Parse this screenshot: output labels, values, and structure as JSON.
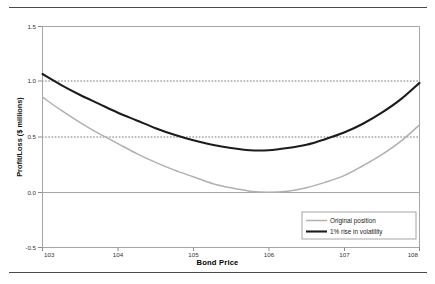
{
  "figure": {
    "clipped_header_text": "",
    "x_axis_title": "Bond Price"
  },
  "chart_data": {
    "type": "line",
    "title": "",
    "xlabel": "Bond Price",
    "ylabel": "Profit/Loss ($ millions)",
    "xlim": [
      103,
      108
    ],
    "ylim": [
      -0.5,
      1.5
    ],
    "xticks": [
      "103",
      "104",
      "105",
      "106",
      "107",
      "108"
    ],
    "yticks": [
      "1.5",
      "1.0",
      "0.5",
      "0.0",
      "-0.5"
    ],
    "grid": "dashed horizontal gridlines at 0.5 and 1.0; solid axis line at 0.0",
    "legend_position": "lower right inside plot",
    "x": [
      103.0,
      103.25,
      103.5,
      103.75,
      104.0,
      104.25,
      104.5,
      104.75,
      105.0,
      105.25,
      105.5,
      105.75,
      106.0,
      106.25,
      106.5,
      106.75,
      107.0,
      107.25,
      107.5,
      107.75,
      108.0
    ],
    "series": [
      {
        "name": "Original position",
        "color": "#b0b0b0",
        "values": [
          0.86,
          0.74,
          0.63,
          0.53,
          0.44,
          0.35,
          0.27,
          0.2,
          0.14,
          0.08,
          0.04,
          0.01,
          0.0,
          0.01,
          0.04,
          0.09,
          0.15,
          0.24,
          0.34,
          0.46,
          0.61
        ]
      },
      {
        "name": "1% rise in volatility",
        "color": "#1c1c1c",
        "values": [
          1.07,
          0.97,
          0.88,
          0.8,
          0.72,
          0.65,
          0.58,
          0.52,
          0.47,
          0.43,
          0.4,
          0.38,
          0.38,
          0.4,
          0.43,
          0.48,
          0.54,
          0.62,
          0.72,
          0.84,
          0.99
        ]
      }
    ]
  }
}
